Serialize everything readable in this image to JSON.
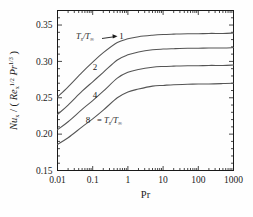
{
  "chart_data": {
    "type": "line",
    "title": "",
    "xlabel": "Pr",
    "ylabel": "Nux / ( Rex^1/2 Pr^1/3 )",
    "xscale": "log",
    "xlim": [
      0.01,
      1000
    ],
    "ylim": [
      0.15,
      0.37
    ],
    "xticks": [
      "0.01",
      "0.1",
      "1",
      "10",
      "100",
      "1000"
    ],
    "xtick_values": [
      0.01,
      0.1,
      1,
      10,
      100,
      1000
    ],
    "yticks": [
      "0.15",
      "0.20",
      "0.25",
      "0.30",
      "0.35"
    ],
    "ytick_values": [
      0.15,
      0.2,
      0.25,
      0.3,
      0.35
    ],
    "grid": false,
    "legend": "inline-curve-labels",
    "annotations": {
      "top_label": "Ts/T∞",
      "top_arrow": "→",
      "bottom_label": "= Ts/T∞"
    },
    "x": [
      0.01,
      0.02,
      0.05,
      0.1,
      0.2,
      0.5,
      1,
      2,
      5,
      10,
      20,
      50,
      100,
      200,
      500,
      1000
    ],
    "series": [
      {
        "name": "1",
        "label": "1",
        "values": [
          0.251,
          0.265,
          0.285,
          0.299,
          0.312,
          0.326,
          0.331,
          0.334,
          0.336,
          0.337,
          0.3375,
          0.338,
          0.338,
          0.3385,
          0.3385,
          0.339
        ]
      },
      {
        "name": "2",
        "label": "2",
        "values": [
          0.227,
          0.24,
          0.259,
          0.272,
          0.285,
          0.302,
          0.309,
          0.313,
          0.316,
          0.317,
          0.3175,
          0.318,
          0.318,
          0.3185,
          0.3185,
          0.319
        ]
      },
      {
        "name": "4",
        "label": "4",
        "values": [
          0.206,
          0.217,
          0.234,
          0.246,
          0.259,
          0.277,
          0.285,
          0.289,
          0.292,
          0.293,
          0.2935,
          0.294,
          0.294,
          0.2945,
          0.2945,
          0.295
        ]
      },
      {
        "name": "8",
        "label": "8",
        "values": [
          0.186,
          0.195,
          0.21,
          0.221,
          0.233,
          0.25,
          0.258,
          0.262,
          0.266,
          0.267,
          0.268,
          0.2685,
          0.269,
          0.269,
          0.2695,
          0.27
        ]
      }
    ]
  },
  "colors": {
    "curve": "#555555",
    "axis": "#1a1a1a",
    "background": "#fefefe"
  }
}
